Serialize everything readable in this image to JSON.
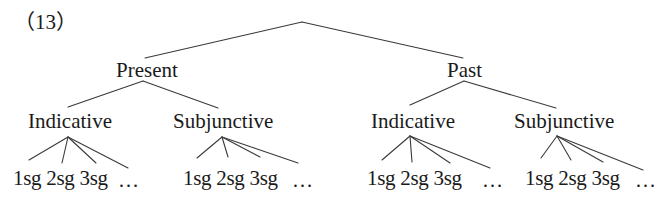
{
  "example_label": "（13）",
  "tree": {
    "root": {
      "label": "",
      "apex": [
        302,
        22
      ],
      "children": [
        "present",
        "past"
      ]
    },
    "nodes": {
      "present": {
        "label": "Present",
        "pos": [
          116,
          60
        ],
        "attach_top": [
          145,
          58
        ],
        "apex": [
          143,
          81
        ]
      },
      "past": {
        "label": "Past",
        "pos": [
          447,
          60
        ],
        "attach_top": [
          463,
          58
        ],
        "apex": [
          464,
          81
        ]
      },
      "present_indicative": {
        "label": "Indicative",
        "pos": [
          28,
          111
        ],
        "attach_top": [
          68,
          107
        ],
        "apex": [
          68,
          137
        ]
      },
      "present_subjunctive": {
        "label": "Subjunctive",
        "pos": [
          173,
          111
        ],
        "attach_top": [
          218,
          108
        ],
        "apex": [
          222,
          137
        ]
      },
      "past_indicative": {
        "label": "Indicative",
        "pos": [
          371,
          111
        ],
        "attach_top": [
          410,
          105
        ],
        "apex": [
          410,
          136
        ]
      },
      "past_subjunctive": {
        "label": "Subjunctive",
        "pos": [
          514,
          111
        ],
        "attach_top": [
          556,
          108
        ],
        "apex": [
          557,
          136
        ]
      }
    },
    "leaf_groups": [
      {
        "parent": "present_indicative",
        "leaves": [
          "1sg",
          "2sg",
          "3sg"
        ],
        "leaf_text": "1sg 2sg 3sg",
        "leaf_pos": [
          13,
          168
        ],
        "ellipsis": "…",
        "ellipsis_pos": [
          118,
          170
        ],
        "endpoints": [
          [
            29,
            160
          ],
          [
            62,
            163
          ],
          [
            96,
            163
          ],
          [
            128,
            168
          ]
        ]
      },
      {
        "parent": "present_subjunctive",
        "leaves": [
          "1sg",
          "2sg",
          "3sg"
        ],
        "leaf_text": "1sg 2sg 3sg",
        "leaf_pos": [
          183,
          168
        ],
        "ellipsis": "…",
        "ellipsis_pos": [
          292,
          170
        ],
        "endpoints": [
          [
            197,
            158
          ],
          [
            228,
            157
          ],
          [
            260,
            157
          ],
          [
            298,
            163
          ]
        ]
      },
      {
        "parent": "past_indicative",
        "leaves": [
          "1sg",
          "2sg",
          "3sg"
        ],
        "leaf_text": "1sg 2sg 3sg",
        "leaf_pos": [
          367,
          168
        ],
        "ellipsis": "…",
        "ellipsis_pos": [
          482,
          170
        ],
        "endpoints": [
          [
            382,
            160
          ],
          [
            412,
            162
          ],
          [
            450,
            163
          ],
          [
            490,
            168
          ]
        ]
      },
      {
        "parent": "past_subjunctive",
        "leaves": [
          "1sg",
          "2sg",
          "3sg"
        ],
        "leaf_text": "1sg 2sg 3sg",
        "leaf_pos": [
          525,
          168
        ],
        "ellipsis": "…",
        "ellipsis_pos": [
          635,
          170
        ],
        "endpoints": [
          [
            541,
            158
          ],
          [
            571,
            160
          ],
          [
            603,
            162
          ],
          [
            643,
            170
          ]
        ]
      }
    ]
  },
  "colors": {
    "text": "#1a1a1a",
    "line": "#3a3a3a",
    "background": "#ffffff"
  }
}
